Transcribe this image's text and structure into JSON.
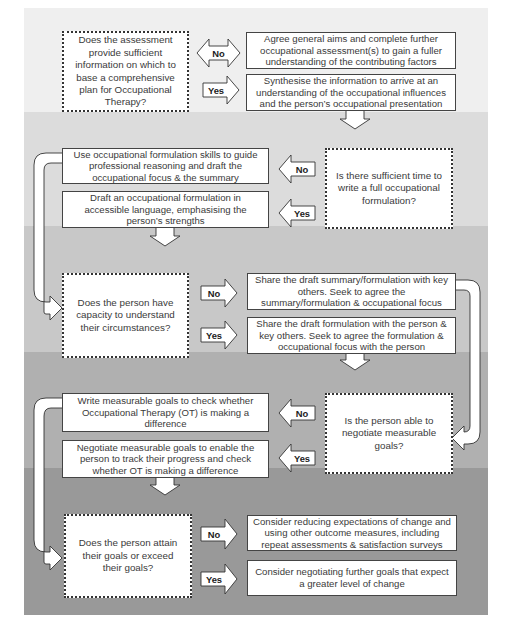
{
  "diagram": {
    "type": "flowchart",
    "band_colors": [
      "#efefef",
      "#dcdcdc",
      "#c8c8c8",
      "#b0b0b0",
      "#999999"
    ],
    "stages": [
      {
        "question": "Does the assessment provide sufficient information on which to base a comprehensive plan for Occupational Therapy?",
        "no_label": "No",
        "yes_label": "Yes",
        "no_outcome": "Agree general aims and complete further occupational assessment(s) to gain a fuller understanding of the contributing factors",
        "yes_outcome": "Synthesise the information to arrive at an understanding of the occupational influences and the person’s occupational presentation"
      },
      {
        "question": "Is there sufficient time to write a full occupational formulation?",
        "no_label": "No",
        "yes_label": "Yes",
        "no_outcome": "Use occupational formulation skills to guide professional reasoning and draft the occupational focus & the summary",
        "yes_outcome": "Draft an occupational formulation in accessible language, emphasising the person’s strengths"
      },
      {
        "question": "Does the person have capacity to understand their circumstances?",
        "no_label": "No",
        "yes_label": "Yes",
        "no_outcome": "Share the draft summary/formulation with key others. Seek to agree the summary/formulation & occupational focus",
        "yes_outcome": "Share the draft formulation with the person & key others. Seek to agree the formulation & occupational focus with the person"
      },
      {
        "question": "Is the person able to negotiate measurable goals?",
        "no_label": "No",
        "yes_label": "Yes",
        "no_outcome": "Write measurable goals to check whether Occupational Therapy (OT) is making a difference",
        "yes_outcome": "Negotiate measurable goals to enable the person to track their progress and check whether OT is making a difference"
      },
      {
        "question": "Does the person attain their goals or exceed their goals?",
        "no_label": "No",
        "yes_label": "Yes",
        "no_outcome": "Consider reducing expectations of change and using other outcome measures, including repeat assessments & satisfaction surveys",
        "yes_outcome": "Consider negotiating further goals that expect a greater level of change"
      }
    ]
  }
}
